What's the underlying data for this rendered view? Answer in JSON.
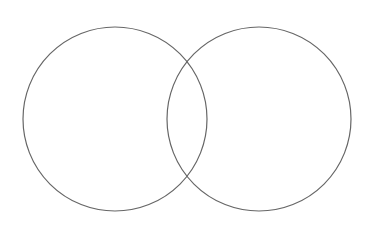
{
  "diagram": {
    "type": "venn",
    "background": "#ffffff",
    "stroke": "#666666",
    "stroke_width": 1.2,
    "circles": [
      {
        "id": "left",
        "cx": 115,
        "cy": 119,
        "r": 92
      },
      {
        "id": "right",
        "cx": 259,
        "cy": 119,
        "r": 92
      }
    ]
  }
}
